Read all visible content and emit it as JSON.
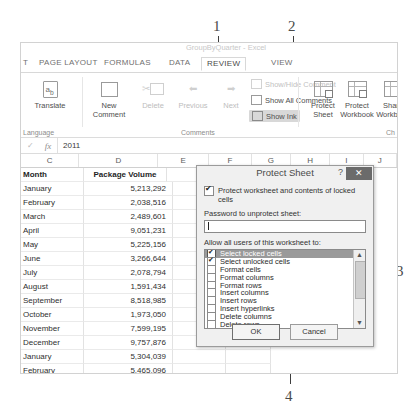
{
  "app": {
    "title": "GroupByQuarter - Excel"
  },
  "ribbon": {
    "tabs": [
      {
        "label": "T",
        "active": false
      },
      {
        "label": "PAGE LAYOUT",
        "active": false
      },
      {
        "label": "FORMULAS",
        "active": false
      },
      {
        "label": "DATA",
        "active": false
      },
      {
        "label": "REVIEW",
        "active": true
      },
      {
        "label": "VIEW",
        "active": false
      }
    ],
    "groups": {
      "language": {
        "label": "Language",
        "translate": "Translate"
      },
      "comments": {
        "label": "Comments",
        "new_comment_line1": "New",
        "new_comment_line2": "Comment",
        "delete": "Delete",
        "previous": "Previous",
        "next": "Next",
        "show_hide_comment": "Show/Hide Comment",
        "show_all_comments": "Show All Comments",
        "show_ink": "Show Ink"
      },
      "changes": {
        "label": "Ch",
        "protect_sheet_line1": "Protect",
        "protect_sheet_line2": "Sheet",
        "protect_workbook_line1": "Protect",
        "protect_workbook_line2": "Workbook",
        "share_workbook_line1": "Share",
        "share_workbook_line2": "Workbook"
      }
    }
  },
  "formula_bar": {
    "value": "2011",
    "check_icon": "✓",
    "fx_icon": "fx"
  },
  "sheet": {
    "column_headers": [
      "C",
      "D",
      "E",
      "F",
      "G",
      "H",
      "I",
      "J"
    ],
    "header_row": {
      "month": "Month",
      "volume": "Package Volume"
    },
    "rows": [
      {
        "month": "January",
        "volume": "5,213,292"
      },
      {
        "month": "February",
        "volume": "2,038,516"
      },
      {
        "month": "March",
        "volume": "2,489,601"
      },
      {
        "month": "April",
        "volume": "9,051,231"
      },
      {
        "month": "May",
        "volume": "5,225,156"
      },
      {
        "month": "June",
        "volume": "3,266,644"
      },
      {
        "month": "July",
        "volume": "2,078,794"
      },
      {
        "month": "August",
        "volume": "1,591,434"
      },
      {
        "month": "September",
        "volume": "8,518,985"
      },
      {
        "month": "October",
        "volume": "1,973,050"
      },
      {
        "month": "November",
        "volume": "7,599,195"
      },
      {
        "month": "December",
        "volume": "9,757,876"
      },
      {
        "month": "January",
        "volume": "5,304,039"
      },
      {
        "month": "February",
        "volume": "5,465,096"
      },
      {
        "month": "March",
        "volume": "1,007,799"
      }
    ]
  },
  "dialog": {
    "title": "Protect Sheet",
    "help_icon": "?",
    "close_icon": "✕",
    "protect_checkbox_label": "Protect worksheet and contents of locked cells",
    "protect_checkbox_checked": true,
    "password_label": "Password to unprotect sheet:",
    "password_value": "",
    "allow_label": "Allow all users of this worksheet to:",
    "permissions": [
      {
        "label": "Select locked cells",
        "checked": true,
        "selected": true
      },
      {
        "label": "Select unlocked cells",
        "checked": true,
        "selected": false
      },
      {
        "label": "Format cells",
        "checked": false,
        "selected": false
      },
      {
        "label": "Format columns",
        "checked": false,
        "selected": false
      },
      {
        "label": "Format rows",
        "checked": false,
        "selected": false
      },
      {
        "label": "Insert columns",
        "checked": false,
        "selected": false
      },
      {
        "label": "Insert rows",
        "checked": false,
        "selected": false
      },
      {
        "label": "Insert hyperlinks",
        "checked": false,
        "selected": false
      },
      {
        "label": "Delete columns",
        "checked": false,
        "selected": false
      },
      {
        "label": "Delete rows",
        "checked": false,
        "selected": false
      }
    ],
    "scroll_up_icon": "▲",
    "scroll_down_icon": "▼",
    "ok_label": "OK",
    "cancel_label": "Cancel"
  },
  "callouts": [
    {
      "number": "1"
    },
    {
      "number": "2"
    },
    {
      "number": "3"
    },
    {
      "number": "4"
    }
  ]
}
